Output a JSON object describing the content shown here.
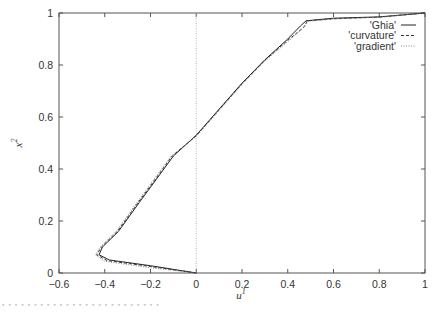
{
  "chart_data": {
    "type": "line",
    "title": "",
    "xlabel": "u",
    "xlabel_superscript": "1",
    "ylabel": "x",
    "ylabel_superscript": "2",
    "xlim": [
      -0.6,
      1
    ],
    "ylim": [
      0,
      1
    ],
    "xticks": [
      "-0.6",
      "-0.4",
      "-0.2",
      "0",
      "0.2",
      "0.4",
      "0.6",
      "0.8",
      "1"
    ],
    "yticks": [
      "0",
      "0.2",
      "0.4",
      "0.6",
      "0.8",
      "1"
    ],
    "grid": false,
    "zero_line": {
      "x": 0,
      "style": "dotted"
    },
    "legend_position": "top-right",
    "series": [
      {
        "name": "'Ghia'",
        "style": "solid",
        "points": [
          [
            0,
            0
          ],
          [
            -0.2,
            0.028
          ],
          [
            -0.38,
            0.05
          ],
          [
            -0.425,
            0.07
          ],
          [
            -0.41,
            0.1
          ],
          [
            -0.34,
            0.16
          ],
          [
            -0.25,
            0.27
          ],
          [
            -0.1,
            0.45
          ],
          [
            0,
            0.53
          ],
          [
            0.1,
            0.63
          ],
          [
            0.2,
            0.73
          ],
          [
            0.3,
            0.82
          ],
          [
            0.4,
            0.9
          ],
          [
            0.455,
            0.95
          ],
          [
            0.48,
            0.97
          ],
          [
            0.6,
            0.98
          ],
          [
            0.8,
            0.985
          ],
          [
            1,
            1
          ]
        ]
      },
      {
        "name": "'curvature'",
        "style": "dashed",
        "points": [
          [
            0,
            0
          ],
          [
            -0.2,
            0.025
          ],
          [
            -0.39,
            0.048
          ],
          [
            -0.435,
            0.07
          ],
          [
            -0.415,
            0.1
          ],
          [
            -0.345,
            0.16
          ],
          [
            -0.255,
            0.27
          ],
          [
            -0.105,
            0.45
          ],
          [
            0,
            0.528
          ],
          [
            0.1,
            0.628
          ],
          [
            0.2,
            0.728
          ],
          [
            0.3,
            0.818
          ],
          [
            0.4,
            0.895
          ],
          [
            0.47,
            0.945
          ],
          [
            0.485,
            0.97
          ],
          [
            0.6,
            0.978
          ],
          [
            0.8,
            0.984
          ],
          [
            1,
            1
          ]
        ]
      },
      {
        "name": "'gradient'",
        "style": "dotted",
        "points": [
          [
            0,
            0
          ],
          [
            -0.2,
            0.02
          ],
          [
            -0.4,
            0.045
          ],
          [
            -0.44,
            0.07
          ],
          [
            -0.42,
            0.1
          ],
          [
            -0.35,
            0.16
          ],
          [
            -0.26,
            0.27
          ],
          [
            -0.11,
            0.45
          ],
          [
            0,
            0.525
          ],
          [
            0.1,
            0.625
          ],
          [
            0.2,
            0.725
          ],
          [
            0.3,
            0.815
          ],
          [
            0.4,
            0.89
          ],
          [
            0.465,
            0.94
          ],
          [
            0.49,
            0.968
          ],
          [
            0.6,
            0.977
          ],
          [
            0.8,
            0.984
          ],
          [
            1,
            1
          ]
        ]
      }
    ]
  },
  "legend": {
    "items": [
      {
        "label": "'Ghia'"
      },
      {
        "label": "'curvature'"
      },
      {
        "label": "'gradient'"
      }
    ]
  },
  "axes": {
    "xlabel": "u",
    "xlabel_sup": "1",
    "ylabel": "x",
    "ylabel_sup": "2"
  }
}
